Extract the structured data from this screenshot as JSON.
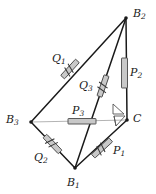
{
  "figure": {
    "background_color": "#ffffff",
    "stroke_color": "#1a1a1a",
    "light_stroke_color": "#b4b4b4",
    "marker_fill_color": "#c8c8c8",
    "marker_stroke_color": "#555555",
    "width": 156,
    "height": 194
  },
  "vertices": [
    {
      "id": "B2",
      "name": "B",
      "sub": "2",
      "x": 126,
      "y": 18,
      "label_x": 133,
      "label_y": 8,
      "interactable": false
    },
    {
      "id": "B3",
      "name": "B",
      "sub": "3",
      "x": 31,
      "y": 122,
      "label_x": 6,
      "label_y": 114,
      "interactable": false
    },
    {
      "id": "B1",
      "name": "B",
      "sub": "1",
      "x": 75,
      "y": 168,
      "label_x": 67,
      "label_y": 177,
      "interactable": false
    },
    {
      "id": "C",
      "name": "C",
      "sub": "",
      "x": 127,
      "y": 120,
      "label_x": 133,
      "label_y": 113,
      "interactable": false
    }
  ],
  "edges": [
    {
      "id": "B2-B3",
      "from": "B2",
      "to": "B3",
      "style": "dark",
      "note": "long upper-left side"
    },
    {
      "id": "B2-B1",
      "from": "B2",
      "to": "B1",
      "style": "dark",
      "note": "cevian through interior"
    },
    {
      "id": "B2-C",
      "from": "B2",
      "to": "C",
      "style": "dark",
      "note": "near vertical right side"
    },
    {
      "id": "B3-B1",
      "from": "B3",
      "to": "B1",
      "style": "dark",
      "note": "lower-left side"
    },
    {
      "id": "B1-C",
      "from": "B1",
      "to": "C",
      "style": "dark",
      "note": "lower-right side"
    },
    {
      "id": "B3-C",
      "from": "B3",
      "to": "C",
      "style": "light",
      "note": "light gray horizontal base"
    }
  ],
  "segment_markers": [
    {
      "id": "Q1",
      "name": "Q",
      "sub": "1",
      "on_edge": "B2-B3",
      "x1": 62,
      "y1": 76,
      "x2": 78,
      "y2": 62,
      "ticks": 2,
      "label_x": 52,
      "label_y": 53
    },
    {
      "id": "Q3",
      "name": "Q",
      "sub": "3",
      "on_edge": "B2-B1",
      "x1": 98,
      "y1": 96,
      "x2": 108,
      "y2": 76,
      "ticks": 2,
      "label_x": 79,
      "label_y": 80
    },
    {
      "id": "Q2",
      "name": "Q",
      "sub": "2",
      "on_edge": "B3-B1",
      "x1": 44,
      "y1": 136,
      "x2": 61,
      "y2": 152,
      "ticks": 2,
      "label_x": 34,
      "label_y": 152
    },
    {
      "id": "P2",
      "name": "P",
      "sub": "2",
      "on_edge": "B2-C",
      "x1": 124,
      "y1": 58,
      "x2": 125,
      "y2": 88,
      "ticks": 0,
      "label_x": 130,
      "label_y": 67
    },
    {
      "id": "P3",
      "name": "P",
      "sub": "3",
      "on_edge": "B3-C",
      "x1": 68,
      "y1": 122,
      "x2": 96,
      "y2": 122,
      "ticks": 0,
      "label_x": 72,
      "label_y": 105
    },
    {
      "id": "P1",
      "name": "P",
      "sub": "1",
      "on_edge": "B1-C",
      "x1": 92,
      "y1": 156,
      "x2": 112,
      "y2": 140,
      "ticks": 2,
      "label_x": 113,
      "label_y": 145
    }
  ],
  "right_angle_marks": [
    {
      "id": "right-angle-upper",
      "x": 113,
      "y": 105,
      "size": 10,
      "orientation": "upper-left-of-C"
    },
    {
      "id": "right-angle-lower",
      "x": 113,
      "y": 118,
      "size": 10,
      "orientation": "lower-left-of-C"
    }
  ]
}
